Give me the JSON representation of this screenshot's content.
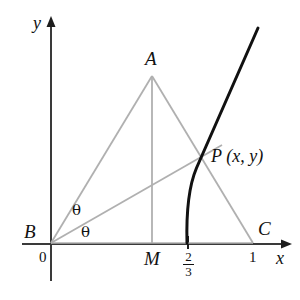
{
  "figure": {
    "axes": {
      "x_label": "x",
      "y_label": "y",
      "origin_label": "0"
    },
    "points": [
      {
        "name": "A",
        "label": "A",
        "x": 152,
        "y": 76
      },
      {
        "name": "B",
        "label": "B",
        "x": 51,
        "y": 243
      },
      {
        "name": "C",
        "label": "C",
        "x": 253,
        "y": 243
      },
      {
        "name": "M",
        "label": "M",
        "x": 152,
        "y": 243
      },
      {
        "name": "P",
        "label": "P (x, y)",
        "x": 206,
        "y": 156
      }
    ],
    "tick_labels": [
      {
        "name": "two-thirds",
        "numerator": "2",
        "denominator": "3",
        "x": 188
      },
      {
        "name": "one",
        "label": "1",
        "x": 253
      }
    ],
    "angles": [
      {
        "name": "theta-upper",
        "label": "θ"
      },
      {
        "name": "theta-lower",
        "label": "θ"
      }
    ],
    "colors": {
      "axis": "#3a3a3a",
      "construction_line": "#b0b0b0",
      "curve": "#111111",
      "text": "#111111"
    },
    "curve": {
      "description": "locus curve crossing x-axis at 2/3 and passing through P",
      "x_intercept": "2/3",
      "path": "M 187,243 C 186.5,215 188.5,186 196,168 C 203,151 228,95 258,28"
    },
    "segments": [
      {
        "name": "segment-BA",
        "from": "B",
        "to": "A"
      },
      {
        "name": "segment-AC",
        "from": "A",
        "to": "C"
      },
      {
        "name": "segment-BC",
        "from": "B",
        "to": "C"
      },
      {
        "name": "segment-AM",
        "from": "A",
        "to": "M"
      },
      {
        "name": "segment-BP",
        "from": "B",
        "to": "P"
      }
    ]
  }
}
